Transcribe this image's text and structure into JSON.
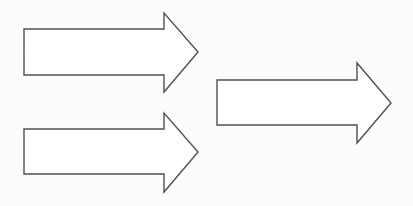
{
  "diagram": {
    "background": "#fcfcfc",
    "stroke_color": "#505050",
    "fill_color": "#ffffff",
    "arrows": [
      {
        "name": "arrow-top-left",
        "direction": "right",
        "points": "24,29 164,29 164,13 198,52 164,92 164,75 24,75"
      },
      {
        "name": "arrow-bottom-left",
        "direction": "right",
        "points": "24,129 164,129 164,113 198,152 164,192 164,174 24,174"
      },
      {
        "name": "arrow-right",
        "direction": "right",
        "points": "217,80 357,80 357,63 391,103 357,143 357,125 217,125"
      }
    ]
  }
}
